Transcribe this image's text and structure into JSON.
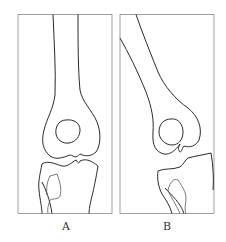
{
  "figure": {
    "panels": [
      {
        "id": "A",
        "label": "A",
        "description": "Knee joint, straight femur (anteroposterior view)"
      },
      {
        "id": "B",
        "label": "B",
        "description": "Knee joint, angled femur (deformity view)"
      }
    ],
    "colors": {
      "line": "#2a2a2a",
      "frame": "#777777",
      "fibula": "#555555",
      "background": "#ffffff"
    }
  }
}
